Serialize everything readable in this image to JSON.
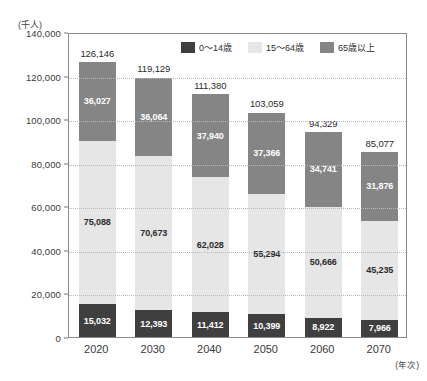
{
  "chart_data": {
    "type": "bar",
    "stacked": true,
    "title": "",
    "subtitle": "",
    "xlabel": "(年次)",
    "ylabel": "(千人)",
    "unit_label": "(千人)",
    "x_axis_note": "(年次)",
    "categories": [
      "2020",
      "2030",
      "2040",
      "2050",
      "2060",
      "2070"
    ],
    "ylim": [
      0,
      140000
    ],
    "ytick_values": [
      0,
      20000,
      40000,
      60000,
      80000,
      100000,
      120000,
      140000
    ],
    "ytick_labels": [
      "0",
      "20,000",
      "40,000",
      "60,000",
      "80,000",
      "100,000",
      "120,000",
      "140,000"
    ],
    "grid": true,
    "grid_style": "dotted",
    "legend_position": "top-inside",
    "series": [
      {
        "name": "0〜14歳",
        "key": "young",
        "color": "#3f3f3f",
        "values": [
          15032,
          12393,
          11412,
          10399,
          8922,
          7966
        ],
        "labels": [
          "15,032",
          "12,393",
          "11,412",
          "10,399",
          "8,922",
          "7,966"
        ]
      },
      {
        "name": "15〜64歳",
        "key": "adult",
        "color": "#e6e6e6",
        "values": [
          75088,
          70673,
          62028,
          55294,
          50666,
          45235
        ],
        "labels": [
          "75,088",
          "70,673",
          "62,028",
          "55,294",
          "50,666",
          "45,235"
        ]
      },
      {
        "name": "65歳以上",
        "key": "old",
        "color": "#858585",
        "values": [
          36027,
          36064,
          37940,
          37366,
          34741,
          31876
        ],
        "labels": [
          "36,027",
          "36,064",
          "37,940",
          "37,366",
          "34,741",
          "31,876"
        ]
      }
    ],
    "totals": [
      126146,
      119129,
      111380,
      103059,
      94329,
      85077
    ],
    "total_labels": [
      "126,146",
      "119,129",
      "111,380",
      "103,059",
      "94,329",
      "85,077"
    ]
  },
  "legend": {
    "items": [
      {
        "label": "0〜14歳",
        "color": "#3f3f3f"
      },
      {
        "label": "15〜64歳",
        "color": "#e6e6e6"
      },
      {
        "label": "65歳以上",
        "color": "#858585"
      }
    ]
  },
  "colors": {
    "young": "#3f3f3f",
    "adult": "#e6e6e6",
    "old": "#858585",
    "grid": "#b9b9b9",
    "border": "#8a8a8a",
    "text": "#333333"
  }
}
